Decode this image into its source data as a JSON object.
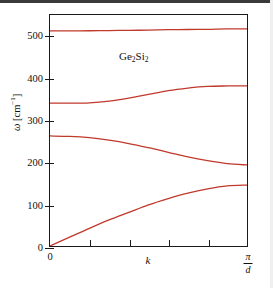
{
  "figure": {
    "annotation": "Ge2Si2",
    "annotation_parts": {
      "a": "Ge",
      "a_sub": "2",
      "b": "Si",
      "b_sub": "2"
    }
  },
  "axes": {
    "y": {
      "title_symbol": "ω",
      "title_unit_open": " [cm",
      "title_unit_exp": "−1",
      "title_unit_close": "]",
      "ticks": [
        "0",
        "100",
        "200",
        "300",
        "400",
        "500"
      ],
      "range": [
        0,
        550
      ]
    },
    "x": {
      "title": "k",
      "min_label": "0",
      "max_label_numerator": "π",
      "max_label_denominator": "d",
      "range": [
        0,
        1
      ]
    }
  },
  "style": {
    "curve_color": "#c0392b",
    "axis_color": "#1a1a1a",
    "background": "#ffffff"
  },
  "chart_data": {
    "type": "line",
    "title": "",
    "subtitle": "",
    "annotations": [
      "Ge2Si2"
    ],
    "xlabel": "k",
    "ylabel": "ω [cm−1]",
    "xlim": [
      0,
      1
    ],
    "ylim": [
      0,
      550
    ],
    "xtick_labels": [
      "0",
      "π/d"
    ],
    "xtick_values": [
      0,
      1
    ],
    "ytick_labels": [
      "0",
      "100",
      "200",
      "300",
      "400",
      "500"
    ],
    "ytick_values": [
      0,
      100,
      200,
      300,
      400,
      500
    ],
    "grid": false,
    "legend": "none",
    "x_units": "k in units of π/d (Brillouin zone boundary)",
    "y_units": "cm^-1",
    "x": [
      0,
      0.1,
      0.2,
      0.3,
      0.4,
      0.5,
      0.6,
      0.7,
      0.8,
      0.9,
      1.0
    ],
    "series": [
      {
        "name": "optical-branch-1",
        "values": [
          512,
          512,
          512.5,
          513,
          513.5,
          514,
          515,
          515.5,
          516,
          517,
          517
        ]
      },
      {
        "name": "optical-branch-2",
        "values": [
          340,
          340,
          341,
          345,
          352,
          361,
          370,
          376,
          380,
          381,
          381
        ]
      },
      {
        "name": "optical-branch-3",
        "values": [
          262,
          261,
          258,
          252,
          244,
          234,
          223,
          212,
          203,
          196,
          193
        ]
      },
      {
        "name": "acoustic-branch",
        "values": [
          0,
          21,
          42,
          62,
          80,
          98,
          113,
          126,
          136,
          143,
          145
        ]
      }
    ]
  }
}
